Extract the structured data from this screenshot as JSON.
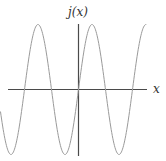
{
  "chart_data": {
    "type": "line",
    "title": "",
    "xlabel": "x",
    "ylabel": "j(x)",
    "function": "sine",
    "series": [
      {
        "name": "j(x)",
        "description": "sinusoid passing through origin, rising; ~2.5 periods visible",
        "x": [
          -2.89,
          -2.5,
          -2.0,
          -1.5,
          -1.0,
          -0.5,
          0,
          0.5,
          1.0,
          1.5,
          2.0,
          2.5,
          2.52
        ],
        "period": 2.0,
        "amplitude": 1.0
      }
    ],
    "xlim": [
      -2.89,
      2.52
    ],
    "ylim": [
      -1,
      1
    ],
    "grid": false,
    "legend": null,
    "colors": {
      "axis": "#4a4a4a",
      "curve": "#9a9a9a"
    }
  },
  "labels": {
    "x_axis": "x",
    "y_axis": "j(x)"
  }
}
